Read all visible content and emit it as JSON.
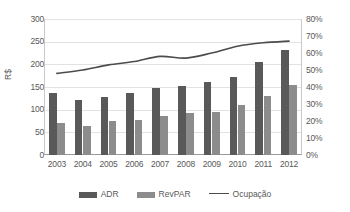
{
  "chart_data": {
    "type": "bar",
    "title": "",
    "xlabel": "",
    "ylabel": "R$",
    "y2label": "",
    "ylim": [
      0,
      300
    ],
    "y2lim": [
      0,
      0.8
    ],
    "grid": true,
    "legend_position": "bottom",
    "categories": [
      "2003",
      "2004",
      "2005",
      "2006",
      "2007",
      "2008",
      "2009",
      "2010",
      "2011",
      "2012"
    ],
    "yticks": [
      "0",
      "50",
      "100",
      "150",
      "200",
      "250",
      "300"
    ],
    "ytick_values": [
      0,
      50,
      100,
      150,
      200,
      250,
      300
    ],
    "y2ticks": [
      "0%",
      "10%",
      "20%",
      "30%",
      "40%",
      "50%",
      "60%",
      "70%",
      "80%"
    ],
    "y2tick_values": [
      0,
      10,
      20,
      30,
      40,
      50,
      60,
      70,
      80
    ],
    "series": [
      {
        "name": "ADR",
        "type": "bar",
        "axis": "left",
        "color": "#595959",
        "values": [
          137,
          122,
          128,
          137,
          148,
          152,
          162,
          172,
          205,
          232
        ]
      },
      {
        "name": "RevPAR",
        "type": "bar",
        "axis": "left",
        "color": "#8c8c8c",
        "values": [
          71,
          65,
          76,
          78,
          86,
          92,
          95,
          111,
          130,
          154
        ]
      },
      {
        "name": "Ocupação",
        "type": "line",
        "axis": "right",
        "color": "#4c4c4c",
        "values": [
          48,
          50,
          53,
          55,
          58,
          57,
          60,
          64,
          66,
          67
        ]
      }
    ]
  },
  "legend": {
    "items": [
      {
        "label": "ADR",
        "marker": "bar-swatch-dark"
      },
      {
        "label": "RevPAR",
        "marker": "bar-swatch-light"
      },
      {
        "label": "Ocupação",
        "marker": "line-swatch"
      }
    ]
  },
  "colors": {
    "adr": "#595959",
    "revpar": "#8c8c8c",
    "ocupacao": "#4c4c4c",
    "grid": "#e2e2e2",
    "axis": "#9a9a9a",
    "text": "#595959"
  }
}
